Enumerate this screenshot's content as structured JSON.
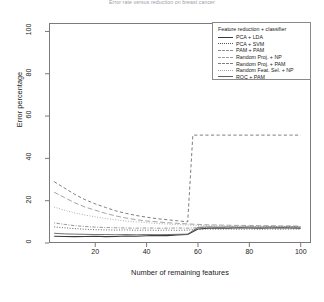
{
  "chart_data": {
    "type": "line",
    "title": "Error rate versus reduction on breast cancer",
    "xlabel": "Number of remaining features",
    "ylabel": "Error percentage",
    "xlim": [
      2,
      104
    ],
    "ylim": [
      0,
      104
    ],
    "xticks": [
      20,
      40,
      60,
      80,
      100
    ],
    "yticks": [
      0,
      20,
      40,
      60,
      80,
      100
    ],
    "grid": false,
    "legend_title": "Feature reduction + classifier",
    "legend_position": "top-right",
    "series": [
      {
        "name": "PCA + LDA",
        "dash": "solid",
        "color": "#3a3a3a",
        "width": 1.1,
        "x": [
          4,
          8,
          12,
          16,
          20,
          24,
          28,
          32,
          36,
          40,
          44,
          48,
          52,
          56,
          60,
          64,
          68,
          72,
          76,
          80,
          84,
          88,
          92,
          96,
          100
        ],
        "y": [
          3.2,
          3.1,
          3.0,
          3.1,
          3.2,
          3.0,
          3.1,
          3.3,
          3.2,
          3.4,
          3.6,
          3.5,
          3.8,
          4.0,
          6.6,
          7.0,
          7.1,
          7.0,
          7.2,
          7.1,
          7.0,
          7.1,
          7.2,
          7.1,
          7.0
        ]
      },
      {
        "name": "PCA + SVM",
        "dash": "dotted",
        "color": "#555555",
        "width": 0.9,
        "x": [
          4,
          8,
          12,
          16,
          20,
          24,
          28,
          32,
          36,
          40,
          44,
          48,
          52,
          56,
          60,
          64,
          68,
          72,
          76,
          80,
          84,
          88,
          92,
          96,
          100
        ],
        "y": [
          7.6,
          7.2,
          6.8,
          6.5,
          6.3,
          6.2,
          6.1,
          6.2,
          6.0,
          6.1,
          6.0,
          6.1,
          6.0,
          6.1,
          6.4,
          6.6,
          6.5,
          6.6,
          6.5,
          6.6,
          6.5,
          6.6,
          6.5,
          6.6,
          6.5
        ]
      },
      {
        "name": "PAM + PAM",
        "dash": "dotdash",
        "color": "#8c8c8c",
        "width": 0.9,
        "x": [
          4,
          8,
          12,
          16,
          20,
          24,
          28,
          32,
          36,
          40,
          44,
          48,
          52,
          56,
          60,
          64,
          68,
          72,
          76,
          80,
          84,
          88,
          92,
          96,
          100
        ],
        "y": [
          9.5,
          8.8,
          8.2,
          7.8,
          7.5,
          7.3,
          7.2,
          7.1,
          7.0,
          7.1,
          7.0,
          7.0,
          7.1,
          7.0,
          7.2,
          7.3,
          7.2,
          7.3,
          7.2,
          7.3,
          7.2,
          7.3,
          7.2,
          7.3,
          7.2
        ]
      },
      {
        "name": "Random Proj. + NP",
        "dash": "longdash",
        "color": "#9a9a9a",
        "width": 0.9,
        "x": [
          4,
          8,
          12,
          16,
          20,
          24,
          28,
          32,
          36,
          40,
          44,
          48,
          52,
          56,
          60,
          64,
          68,
          72,
          76,
          80,
          84,
          88,
          92,
          96,
          100
        ],
        "y": [
          24.0,
          21.5,
          19.0,
          17.0,
          15.5,
          14.0,
          12.8,
          11.8,
          11.0,
          10.4,
          10.0,
          9.6,
          9.3,
          9.0,
          8.8,
          8.6,
          8.5,
          8.4,
          8.3,
          8.3,
          8.2,
          8.2,
          8.1,
          8.1,
          8.0
        ]
      },
      {
        "name": "Random Proj. + PAM",
        "dash": "dashed",
        "color": "#7d7d7d",
        "width": 1.0,
        "x": [
          4,
          8,
          12,
          16,
          20,
          24,
          28,
          32,
          36,
          40,
          44,
          48,
          52,
          56,
          58,
          60,
          64,
          68,
          72,
          76,
          80,
          84,
          88,
          92,
          96,
          100
        ],
        "y": [
          29.0,
          26.0,
          23.0,
          20.5,
          18.5,
          16.8,
          15.2,
          14.0,
          13.0,
          12.2,
          11.5,
          11.0,
          10.5,
          10.0,
          51.0,
          51.0,
          51.0,
          51.0,
          51.0,
          51.0,
          51.0,
          51.0,
          51.0,
          51.0,
          51.0,
          51.0
        ]
      },
      {
        "name": "Random Feat. Sel. + NP",
        "dash": "dotted",
        "color": "#a5a5a5",
        "width": 0.9,
        "x": [
          4,
          8,
          12,
          16,
          20,
          24,
          28,
          32,
          36,
          40,
          44,
          48,
          52,
          56,
          60,
          64,
          68,
          72,
          76,
          80,
          84,
          88,
          92,
          96,
          100
        ],
        "y": [
          17.0,
          15.5,
          14.2,
          13.2,
          12.4,
          11.6,
          11.0,
          10.4,
          10.0,
          9.6,
          9.2,
          9.0,
          8.7,
          8.5,
          8.3,
          8.2,
          8.1,
          8.0,
          8.0,
          7.9,
          7.9,
          7.8,
          7.8,
          7.8,
          7.7
        ]
      },
      {
        "name": "ROC + PAM",
        "dash": "solid",
        "color": "#606060",
        "width": 0.9,
        "x": [
          4,
          8,
          12,
          16,
          20,
          24,
          28,
          32,
          36,
          40,
          44,
          48,
          52,
          56,
          60,
          64,
          68,
          72,
          76,
          80,
          84,
          88,
          92,
          96,
          100
        ],
        "y": [
          4.6,
          4.3,
          4.2,
          4.1,
          4.0,
          4.0,
          3.9,
          4.0,
          3.9,
          4.0,
          3.9,
          4.0,
          4.1,
          4.2,
          7.4,
          7.6,
          7.5,
          7.6,
          7.5,
          7.6,
          7.5,
          7.6,
          7.5,
          7.6,
          7.5
        ]
      }
    ]
  }
}
